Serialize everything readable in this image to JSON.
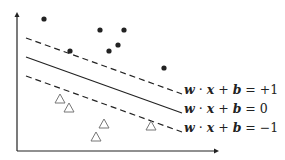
{
  "diagram": {
    "colors": {
      "ink": "#222222",
      "triangle": "#777777",
      "background": "#ffffff"
    },
    "axes": {
      "origin": [
        17,
        151
      ],
      "y_top": 12,
      "x_right": 219
    },
    "lines": [
      {
        "name": "margin-positive",
        "style": "dashed",
        "from": [
          26,
          38
        ],
        "to": [
          182,
          94
        ],
        "label": {
          "w": "w",
          "dot": "·",
          "x": "x",
          "plus": "+",
          "b": "b",
          "eq": "=",
          "rhs": "+1"
        }
      },
      {
        "name": "decision-boundary",
        "style": "solid",
        "from": [
          26,
          57
        ],
        "to": [
          182,
          113
        ],
        "label": {
          "w": "w",
          "dot": "·",
          "x": "x",
          "plus": "+",
          "b": "b",
          "eq": "=",
          "rhs": "0"
        }
      },
      {
        "name": "margin-negative",
        "style": "dashed",
        "from": [
          26,
          76
        ],
        "to": [
          182,
          132
        ],
        "label": {
          "w": "w",
          "dot": "·",
          "x": "x",
          "plus": "+",
          "b": "b",
          "eq": "=",
          "rhs": "−1"
        }
      }
    ],
    "positive_points": [
      [
        44,
        19
      ],
      [
        70,
        51
      ],
      [
        100,
        30
      ],
      [
        124,
        30
      ],
      [
        109,
        51
      ],
      [
        118,
        45
      ],
      [
        164,
        68
      ]
    ],
    "negative_points": [
      [
        60,
        99
      ],
      [
        69,
        108
      ],
      [
        104,
        124
      ],
      [
        96,
        137
      ],
      [
        151,
        126
      ]
    ]
  }
}
